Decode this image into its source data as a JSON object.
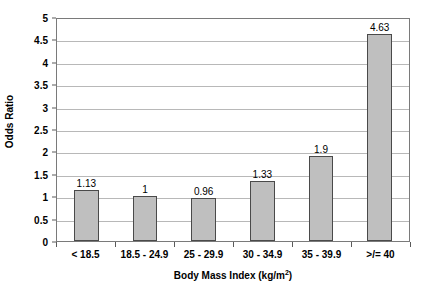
{
  "chart_data": {
    "type": "bar",
    "title": "",
    "xlabel": "Body Mass Index (kg/m",
    "xlabel_superscript": "2",
    "xlabel_suffix": ")",
    "ylabel": "Odds Ratio",
    "categories": [
      "< 18.5",
      "18.5 - 24.9",
      "25 - 29.9",
      "30 - 34.9",
      "35 - 39.9",
      ">/= 40"
    ],
    "values": [
      1.13,
      1,
      0.96,
      1.33,
      1.9,
      4.63
    ],
    "value_labels": [
      "1.13",
      "1",
      "0.96",
      "1.33",
      "1.9",
      "4.63"
    ],
    "ylim": [
      0,
      5
    ],
    "ytick_step": 0.5,
    "ytick_labels": [
      "5",
      "4.5",
      "4",
      "3.5",
      "3",
      "2.5",
      "2",
      "1.5",
      "1",
      "0.5",
      "0"
    ],
    "ytick_values": [
      5,
      4.5,
      4,
      3.5,
      3,
      2.5,
      2,
      1.5,
      1,
      0.5,
      0
    ],
    "grid": true,
    "legend": false,
    "bar_fill_color": "#BFBFBF",
    "bar_border_color": "#4A4A4A",
    "gridline_color": "#B8B8B8",
    "axis_color": "#7A7A7A",
    "background_color": "#FFFFFF"
  }
}
